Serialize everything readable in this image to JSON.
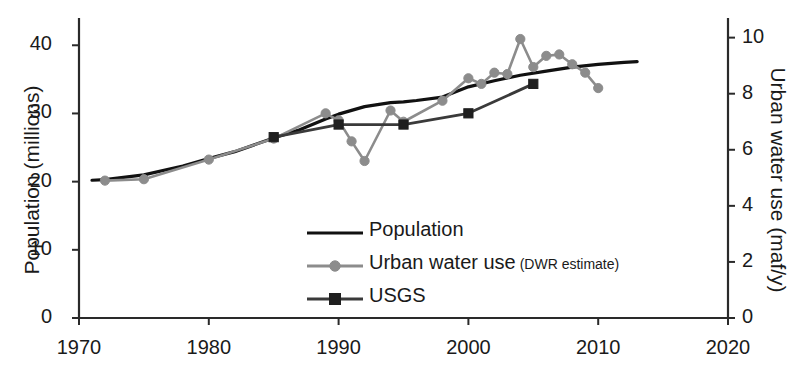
{
  "chart_data": {
    "type": "line",
    "title": "",
    "xlabel": "",
    "ylabel": "Population (millions)",
    "ylabel_right": "Urban water use (maf/y)",
    "xlim": [
      1970,
      2020
    ],
    "ylim": [
      0,
      44
    ],
    "ylim_right": [
      0,
      10.7
    ],
    "xticks": [
      "1970",
      "1980",
      "1990",
      "2000",
      "2010",
      "2020"
    ],
    "xtick_values": [
      1970,
      1980,
      1990,
      2000,
      2010,
      2020
    ],
    "yticks_left": [
      "0",
      "10",
      "20",
      "30",
      "40"
    ],
    "ytick_values_left": [
      0,
      10,
      20,
      30,
      40
    ],
    "yticks_right": [
      "0",
      "2",
      "4",
      "6",
      "8",
      "10"
    ],
    "ytick_values_right": [
      0,
      2,
      4,
      6,
      8,
      10
    ],
    "grid": false,
    "legend_position": "center",
    "series": [
      {
        "name": "Population",
        "axis": "left",
        "color": "#111111",
        "marker": "none",
        "linewidth": 3.2,
        "points": [
          [
            1971,
            20.2
          ],
          [
            1972,
            20.3
          ],
          [
            1975,
            21.0
          ],
          [
            1978,
            22.3
          ],
          [
            1980,
            23.4
          ],
          [
            1982,
            24.4
          ],
          [
            1985,
            26.4
          ],
          [
            1987,
            27.6
          ],
          [
            1989,
            29.2
          ],
          [
            1990,
            29.9
          ],
          [
            1992,
            31.0
          ],
          [
            1994,
            31.6
          ],
          [
            1995,
            31.7
          ],
          [
            1996,
            31.9
          ],
          [
            1998,
            32.4
          ],
          [
            2000,
            33.9
          ],
          [
            2002,
            34.8
          ],
          [
            2004,
            35.6
          ],
          [
            2006,
            36.2
          ],
          [
            2008,
            36.8
          ],
          [
            2010,
            37.2
          ],
          [
            2012,
            37.5
          ],
          [
            2013,
            37.6
          ]
        ]
      },
      {
        "name": "Urban water use (DWR estimate)",
        "name_main": "Urban water use",
        "name_note": "(DWR estimate)",
        "axis": "right",
        "color": "#8c8c8c",
        "marker": "circle",
        "linewidth": 2.6,
        "points": [
          [
            1972,
            4.9
          ],
          [
            1975,
            4.95
          ],
          [
            1980,
            5.65
          ],
          [
            1985,
            6.4
          ],
          [
            1989,
            7.3
          ],
          [
            1990,
            7.05
          ],
          [
            1991,
            6.3
          ],
          [
            1992,
            5.6
          ],
          [
            1994,
            7.4
          ],
          [
            1995,
            7.0
          ],
          [
            1998,
            7.75
          ],
          [
            2000,
            8.55
          ],
          [
            2001,
            8.35
          ],
          [
            2002,
            8.75
          ],
          [
            2003,
            8.7
          ],
          [
            2004,
            9.95
          ],
          [
            2005,
            8.95
          ],
          [
            2006,
            9.35
          ],
          [
            2007,
            9.4
          ],
          [
            2008,
            9.05
          ],
          [
            2009,
            8.75
          ],
          [
            2010,
            8.2
          ]
        ]
      },
      {
        "name": "USGS",
        "axis": "right",
        "color": "#3a3a3a",
        "marker": "square",
        "linewidth": 2.8,
        "points": [
          [
            1985,
            6.45
          ],
          [
            1990,
            6.9
          ],
          [
            1995,
            6.9
          ],
          [
            2000,
            7.3
          ],
          [
            2005,
            8.35
          ]
        ]
      }
    ],
    "legend": [
      {
        "label": "Population",
        "color": "#111111",
        "marker": "none"
      },
      {
        "label": "Urban water use",
        "note": "(DWR estimate)",
        "color": "#8c8c8c",
        "marker": "circle"
      },
      {
        "label": "USGS",
        "color": "#3a3a3a",
        "marker": "square"
      }
    ]
  },
  "axes": {
    "left_title": "Population (millions)",
    "right_title": "Urban water use (maf/y)"
  }
}
